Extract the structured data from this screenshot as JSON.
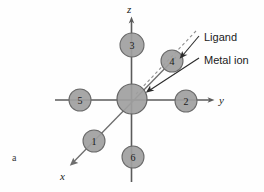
{
  "figure": {
    "panel_label": "a",
    "axes": [
      {
        "name": "z",
        "label": "z"
      },
      {
        "name": "y",
        "label": "y"
      },
      {
        "name": "x",
        "label": "x"
      }
    ],
    "callouts": [
      {
        "name": "ligand",
        "label": "Ligand"
      },
      {
        "name": "metal-ion",
        "label": "Metal ion"
      }
    ],
    "ligand_sites": [
      {
        "id": "1",
        "label": "1",
        "cx": 94,
        "cy": 141,
        "r": 11
      },
      {
        "id": "2",
        "label": "2",
        "cx": 186,
        "cy": 101,
        "r": 11
      },
      {
        "id": "3",
        "label": "3",
        "cx": 132,
        "cy": 45,
        "r": 12
      },
      {
        "id": "4",
        "label": "4",
        "cx": 172,
        "cy": 61,
        "r": 11
      },
      {
        "id": "5",
        "label": "5",
        "cx": 80,
        "cy": 100,
        "r": 11
      },
      {
        "id": "6",
        "label": "6",
        "cx": 133,
        "cy": 157,
        "r": 11
      }
    ],
    "metal_center": {
      "cx": 132,
      "cy": 99,
      "r": 15
    },
    "colors": {
      "sphere_fill": "#a0a0a0",
      "sphere_stroke": "#6a6a6a",
      "axis_stroke": "#5b5b5b",
      "dashed_bond": "#8f8f8f",
      "callout_stroke": "#2b2b2b",
      "background": "#fefefe"
    }
  }
}
